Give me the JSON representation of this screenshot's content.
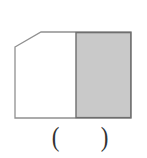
{
  "figure": {
    "unshaded_fill": "#ffffff",
    "outline_color": "#909090",
    "shaded_fill": "#c9c9c9",
    "shaded_border_color": "#6e6e6e"
  },
  "answer_blank": {
    "open_paren": "(",
    "close_paren": ")"
  }
}
